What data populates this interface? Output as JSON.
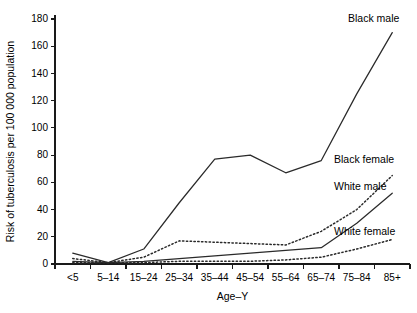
{
  "chart_data": {
    "type": "line",
    "title": "",
    "xlabel": "Age–Y",
    "ylabel": "Risk of tuberculosis per 100 000 population",
    "categories": [
      "<5",
      "5–14",
      "15–24",
      "25–34",
      "35–44",
      "45–54",
      "55–64",
      "65–74",
      "75–84",
      "85+"
    ],
    "ylim": [
      0,
      180
    ],
    "yticks": [
      0,
      20,
      40,
      60,
      80,
      100,
      120,
      140,
      160,
      180
    ],
    "ytick_labels": [
      "0",
      "20",
      "40",
      "60",
      "80",
      "100",
      "120",
      "140",
      "160",
      "180"
    ],
    "grid": false,
    "legend_position": "inline-right-labels",
    "series": [
      {
        "name": "Black male",
        "style": "solid",
        "color": "#2a2a2a",
        "values": [
          8,
          1,
          11,
          45,
          77,
          80,
          67,
          76,
          125,
          170
        ]
      },
      {
        "name": "Black female",
        "style": "dotted",
        "color": "#2a2a2a",
        "values": [
          4,
          1,
          5,
          17,
          16,
          15,
          14,
          24,
          40,
          65
        ]
      },
      {
        "name": "White male",
        "style": "solid",
        "color": "#2a2a2a",
        "values": [
          2,
          1,
          2,
          4,
          6,
          8,
          10,
          12,
          30,
          52
        ]
      },
      {
        "name": "White female",
        "style": "dotted",
        "color": "#2a2a2a",
        "values": [
          1,
          1,
          1,
          2,
          2,
          2,
          3,
          5,
          11,
          18
        ]
      }
    ],
    "annotations": [
      {
        "text": "Black male",
        "series": "Black male"
      },
      {
        "text": "Black female",
        "series": "Black female"
      },
      {
        "text": "White male",
        "series": "White male"
      },
      {
        "text": "White female",
        "series": "White female"
      }
    ]
  }
}
